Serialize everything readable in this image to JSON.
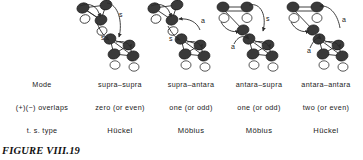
{
  "figure": {
    "caption": "FIGURE VIII.19"
  },
  "table": {
    "row_labels": {
      "mode": "Mode",
      "overlaps": "(+)(−) overlaps",
      "ts_type": "t. s. type"
    },
    "columns": [
      {
        "mode": "supra–supra",
        "overlaps": "zero (or even)",
        "ts_type": "Hückel",
        "top_label": "s",
        "bottom_label": "s"
      },
      {
        "mode": "supra–antara",
        "overlaps": "one (or odd)",
        "ts_type": "Möbius",
        "top_label": "a",
        "bottom_label": "s"
      },
      {
        "mode": "antara–supra",
        "overlaps": "one (or odd)",
        "ts_type": "Möbius",
        "top_label": "s",
        "bottom_label": "a"
      },
      {
        "mode": "antara–antara",
        "overlaps": "two (or even)",
        "ts_type": "Hückel",
        "top_label": "a",
        "bottom_label": "a"
      }
    ]
  },
  "diagram": {
    "lobe_dark_color": "#3a3a3a",
    "lobe_light_color": "#ffffff",
    "line_color": "#2b2b2b"
  }
}
